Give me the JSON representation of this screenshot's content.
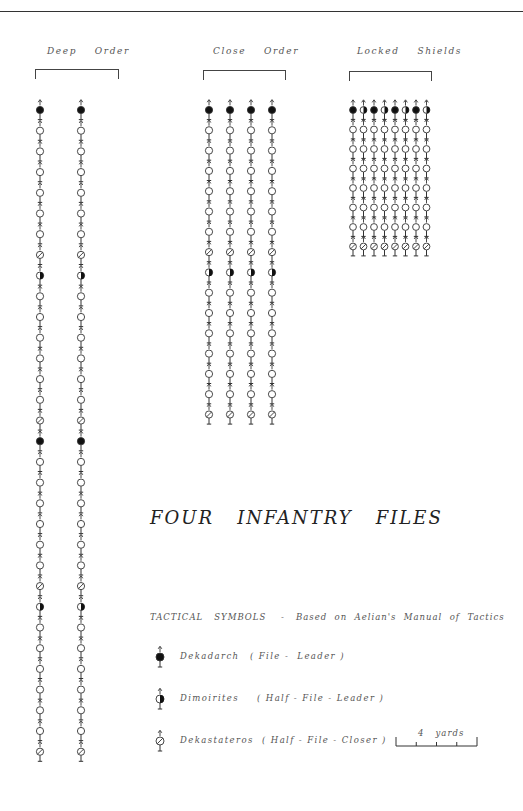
{
  "title": "FOUR   INFANTRY   FILES",
  "groups": [
    {
      "label": "Deep    Order",
      "label_x": 47,
      "label_y": 46,
      "bracket": {
        "x": 35,
        "y": 69,
        "w": 82
      },
      "columns_x": [
        40,
        81
      ],
      "start_y": 110,
      "pitch_y": 20.7,
      "sequence": [
        "F",
        "H",
        "H",
        "H",
        "H",
        "H",
        "H",
        "X",
        "D",
        "H",
        "H",
        "H",
        "H",
        "H",
        "H",
        "X",
        "F",
        "H",
        "H",
        "H",
        "H",
        "H",
        "H",
        "X",
        "D",
        "H",
        "H",
        "H",
        "H",
        "H",
        "H",
        "X"
      ]
    },
    {
      "label": "Close    Order",
      "label_x": 213,
      "label_y": 46,
      "bracket": {
        "x": 203,
        "y": 70,
        "w": 81
      },
      "columns_x": [
        209,
        230,
        251,
        272
      ],
      "start_y": 110,
      "pitch_y": 20.3,
      "sequence": [
        "F",
        "H",
        "H",
        "H",
        "H",
        "H",
        "H",
        "X",
        "D",
        "H",
        "H",
        "H",
        "H",
        "H",
        "H",
        "X"
      ]
    },
    {
      "label": "Locked    Shields",
      "label_x": 357,
      "label_y": 46,
      "bracket": {
        "x": 349,
        "y": 71,
        "w": 81
      },
      "columns_x": [
        353,
        363.5,
        374,
        384.5,
        395,
        405.5,
        416,
        426.5
      ],
      "start_y": 110,
      "pitch_y": 19.5,
      "top_row": [
        "F",
        "D",
        "F",
        "D",
        "F",
        "D",
        "F",
        "D"
      ],
      "sequence": [
        "TOP",
        "H",
        "H",
        "H",
        "H",
        "H",
        "H",
        "X"
      ]
    }
  ],
  "legend": {
    "heading": "TACTICAL   SYMBOLS    -   Based  on  Aelian's  Manual  of  Tactics",
    "items": [
      {
        "symbol": "F",
        "name": "Dekadarch",
        "desc": "( File -  Leader )",
        "y": 653,
        "desc_x": 100
      },
      {
        "symbol": "D",
        "name": "Dimoirites",
        "desc": "( Half - File - Leader )",
        "y": 695,
        "desc_x": 107
      },
      {
        "symbol": "X",
        "name": "Dekastateros",
        "desc": "( Half - File - Closer )",
        "y": 737,
        "desc_x": 112
      }
    ]
  },
  "scale": {
    "label": "4   yards",
    "x1": 396,
    "x2": 477,
    "y": 746,
    "segments": 4
  },
  "symbol_key": {
    "F": "filled-circle",
    "D": "half-filled-circle",
    "H": "hollow-circle",
    "X": "hatched-circle"
  },
  "colors": {
    "ink": "#333333",
    "text": "#555555",
    "background": "#ffffff"
  }
}
